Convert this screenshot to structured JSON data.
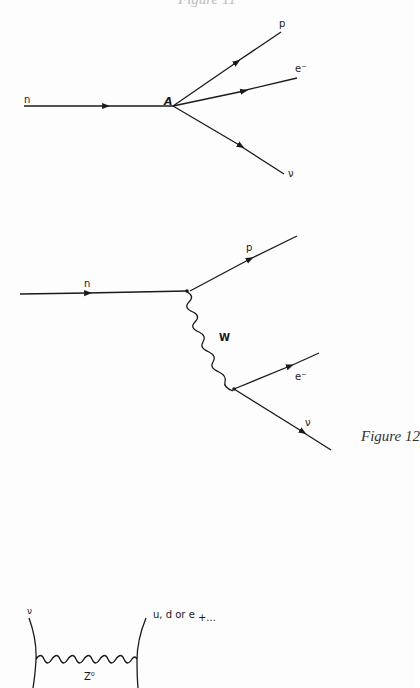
{
  "page": {
    "top_cut_caption": "Figure 11",
    "caption": "Figure 12"
  },
  "diagram_1": {
    "title": "Fermi four-fermion beta decay",
    "vertex_label": "A",
    "incoming": {
      "label": "n"
    },
    "outgoing": [
      {
        "label": "p"
      },
      {
        "label": "e⁻"
      },
      {
        "label": "ν"
      }
    ]
  },
  "diagram_2": {
    "title": "Beta decay via W boson exchange",
    "incoming": {
      "label": "n"
    },
    "upper_outgoing": {
      "label": "p"
    },
    "boson": {
      "label": "W"
    },
    "lower_outgoing": [
      {
        "label": "e⁻"
      },
      {
        "label": "ν"
      }
    ]
  },
  "diagram_3": {
    "title": "Neutral current Z exchange",
    "left_particle": {
      "label": "ν"
    },
    "right_particle": {
      "label": "u, d or e",
      "suffix": "+..."
    },
    "boson": {
      "label": "Z⁰"
    }
  }
}
